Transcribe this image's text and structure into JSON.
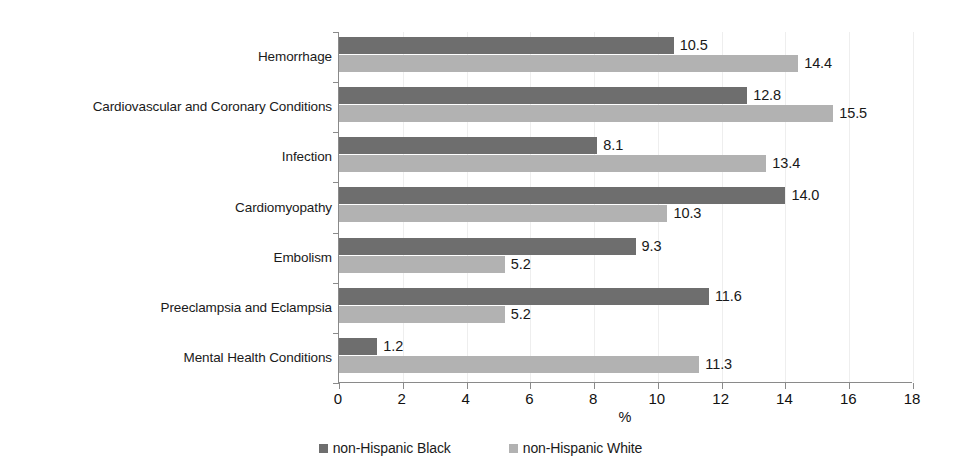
{
  "chart_data": {
    "type": "bar",
    "orientation": "horizontal",
    "title": "",
    "xlabel": "%",
    "ylabel": "",
    "xlim": [
      0,
      18
    ],
    "xticks": [
      0,
      2,
      4,
      6,
      8,
      10,
      12,
      14,
      16,
      18
    ],
    "xtick_labels": [
      "0",
      "2",
      "4",
      "6",
      "8",
      "10",
      "12",
      "14",
      "16",
      "18"
    ],
    "grid": true,
    "legend_position": "bottom",
    "categories": [
      "Hemorrhage",
      "Cardiovascular and Coronary Conditions",
      "Infection",
      "Cardiomyopathy",
      "Embolism",
      "Preeclampsia and Eclampsia",
      "Mental Health Conditions"
    ],
    "series": [
      {
        "name": "non-Hispanic Black",
        "color": "#6e6e6e",
        "values": [
          10.5,
          12.8,
          8.1,
          14.0,
          9.3,
          11.6,
          1.2
        ],
        "labels": [
          "10.5",
          "12.8",
          "8.1",
          "14.0",
          "9.3",
          "11.6",
          "1.2"
        ]
      },
      {
        "name": "non-Hispanic White",
        "color": "#b2b2b2",
        "values": [
          14.4,
          15.5,
          13.4,
          10.3,
          5.2,
          5.2,
          11.3
        ],
        "labels": [
          "14.4",
          "15.5",
          "13.4",
          "10.3",
          "5.2",
          "5.2",
          "11.3"
        ]
      }
    ]
  },
  "legend": {
    "items": [
      {
        "label": "non-Hispanic Black",
        "color": "#6e6e6e"
      },
      {
        "label": "non-Hispanic White",
        "color": "#b2b2b2"
      }
    ]
  },
  "axis": {
    "x_title": "%"
  }
}
